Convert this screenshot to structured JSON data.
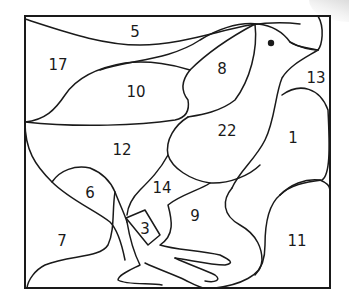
{
  "puzzle": {
    "type": "color-by-number region diagram",
    "subject": "bird (chick) standing",
    "regions": [
      {
        "id": "r5",
        "label": "5",
        "x": 135,
        "y": 32
      },
      {
        "id": "r17",
        "label": "17",
        "x": 58,
        "y": 65
      },
      {
        "id": "r10",
        "label": "10",
        "x": 136,
        "y": 92
      },
      {
        "id": "r8",
        "label": "8",
        "x": 222,
        "y": 69
      },
      {
        "id": "r13",
        "label": "13",
        "x": 316,
        "y": 78
      },
      {
        "id": "r22",
        "label": "22",
        "x": 227,
        "y": 131
      },
      {
        "id": "r1",
        "label": "1",
        "x": 293,
        "y": 138
      },
      {
        "id": "r12",
        "label": "12",
        "x": 122,
        "y": 150
      },
      {
        "id": "r6",
        "label": "6",
        "x": 90,
        "y": 193
      },
      {
        "id": "r14",
        "label": "14",
        "x": 162,
        "y": 188
      },
      {
        "id": "r9",
        "label": "9",
        "x": 195,
        "y": 216
      },
      {
        "id": "r3",
        "label": "3",
        "x": 145,
        "y": 229
      },
      {
        "id": "r7",
        "label": "7",
        "x": 62,
        "y": 241
      },
      {
        "id": "r11",
        "label": "11",
        "x": 297,
        "y": 241
      }
    ],
    "colors": {
      "stroke": "#1a1a1a",
      "background": "#ffffff"
    }
  }
}
